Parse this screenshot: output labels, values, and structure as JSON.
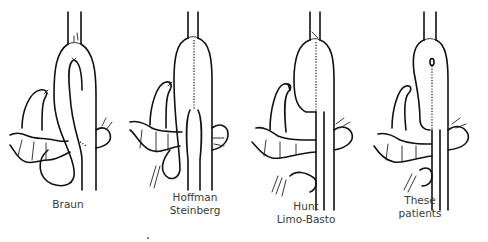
{
  "diagram": {
    "type": "surgical-illustration",
    "panels": [
      {
        "id": "braun",
        "label_lines": [
          "Braun"
        ]
      },
      {
        "id": "hoffman-steinberg",
        "label_lines": [
          "Hoffman",
          "Steinberg"
        ]
      },
      {
        "id": "hunt-limo-basto",
        "label_lines": [
          "Hunt",
          "Limo-Basto"
        ]
      },
      {
        "id": "these-patients",
        "label_lines": [
          "These",
          "patients"
        ]
      }
    ]
  }
}
